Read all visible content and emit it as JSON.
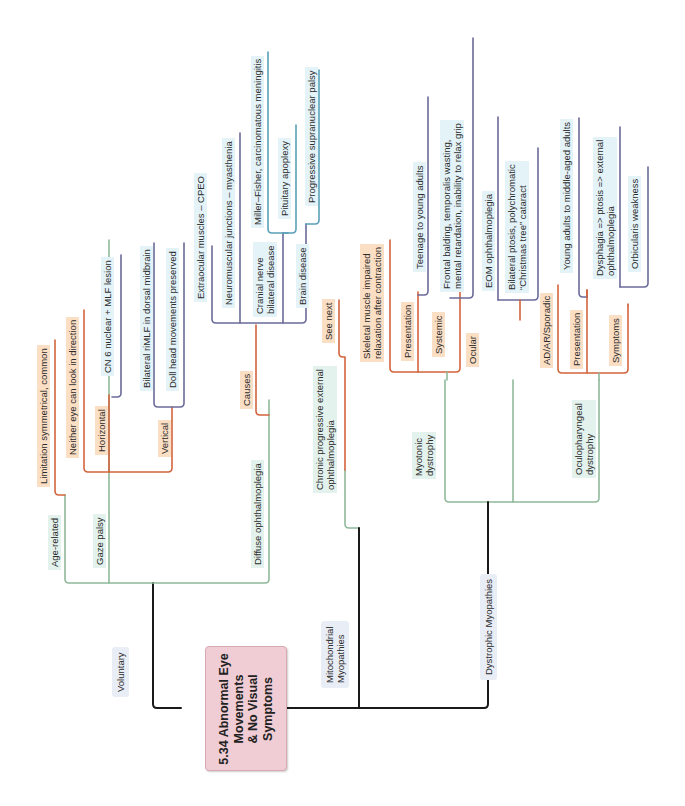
{
  "diagram": {
    "type": "mind-map",
    "orientation": "rotated-90-ccw",
    "colors": {
      "root_fill": "#f0cdd4",
      "trunk_line": "#1a1a1a",
      "green_line": "#8fb99a",
      "orange_line": "#d2643c",
      "purple_line": "#6b6b9a",
      "teal_line": "#5aa0b8",
      "green_chip": "#e3f2ec",
      "orange_chip": "#fbdfc4",
      "blue_chip": "#e3f3f8",
      "branch_chip": "#e9edf5"
    },
    "root": {
      "line1": "5.34 Abnormal Eye",
      "line2": "Movements",
      "line3": "& No  Visual",
      "line4": "Symptoms"
    },
    "branches": {
      "voluntary": {
        "label": "Voluntary",
        "age_related": {
          "label": "Age-related",
          "detail": "Limitation symmetrical, common"
        },
        "gaze_palsy": {
          "label": "Gaze palsy",
          "detail": "Neither eye can look in direction",
          "horizontal": {
            "label": "Horizontal",
            "detail": "CN 6 nuclear + MLF lesion"
          },
          "vertical": {
            "label": "Vertical",
            "detail1": "Bilateral riMLF in dorsal midbrain",
            "detail2": "Doll head movements preserved"
          }
        },
        "diffuse": {
          "label": "Diffuse ophthalmoplegia",
          "causes": {
            "label": "Causes",
            "extraocular": "Extraocular muscles – CPEO",
            "nmj": "Neuromuscular junctions – myasthenia",
            "cranial_nerve": {
              "line1": "Cranial nerve",
              "line2": "bilateral disease",
              "miller_fisher": "Miller–Fisher, carcinomatous meningitis",
              "pituitary": "Pituitary apoplexy"
            },
            "brain": {
              "label": "Brain disease",
              "psp": "Progressive supranuclear palsy"
            }
          }
        }
      },
      "mitochondrial": {
        "line1": "Mitochondrial",
        "line2": "Myopathies",
        "cpeo": {
          "line1": "Chronic progressive external",
          "line2": "ophthalmoplegia",
          "see_next": "See next"
        }
      },
      "dystrophic": {
        "label": "Dystrophic Myopathies",
        "myotonic": {
          "line1": "Myotonic",
          "line2": "dystrophy",
          "definition": {
            "line1": "Skeletal muscle impaired",
            "line2": "relaxation after contraction"
          },
          "presentation": {
            "label": "Presentation",
            "detail": "Teenage to young adults"
          },
          "systemic": {
            "label": "Systemic",
            "line1": "Frontal balding, temporalis wasting,",
            "line2": "mental retardation, inability to relax grip"
          },
          "ocular": {
            "label": "Ocular",
            "eom": "EOM ophthalmoplegia",
            "ptosis_line1": "Bilateral ptosis, polychromatic",
            "ptosis_line2": "“Christmas tree” cataract"
          }
        },
        "oculopharyngeal": {
          "line1": "Oculopharyngeal",
          "line2": "dystrophy",
          "inheritance": "AD/AR/Sporadic",
          "presentation": {
            "label": "Presentation",
            "detail": "Young adults to middle-aged adults"
          },
          "symptoms": {
            "label": "Symptoms",
            "line1": "Dysphagia => ptosis => external",
            "line2": "ophthalmoplegia",
            "orbicularis": "Orbicularis weakness"
          }
        }
      }
    }
  }
}
